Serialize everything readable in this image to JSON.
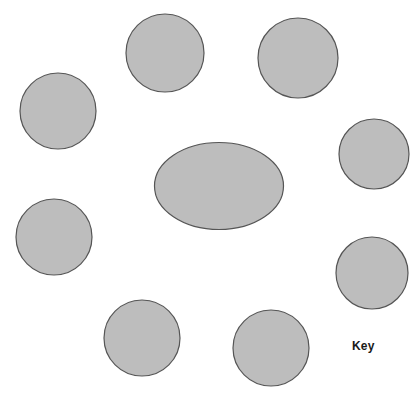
{
  "figure": {
    "type": "node-diagram",
    "background_color": "#ffffff",
    "shape_fill_color": "#bdbdbd",
    "shape_stroke_color": "#555555",
    "shape_stroke_width": 1.2,
    "width": 419,
    "height": 393
  },
  "center_node": {
    "name": "central-ellipse",
    "shape": "ellipse",
    "cx": 219,
    "cy": 186,
    "rx": 64.5,
    "ry": 43.5,
    "label": ""
  },
  "satellite_nodes": [
    {
      "name": "node-top-center",
      "shape": "circle",
      "cx": 165,
      "cy": 53,
      "r": 39,
      "label": ""
    },
    {
      "name": "node-top-right",
      "shape": "circle",
      "cx": 298,
      "cy": 58,
      "r": 40,
      "label": ""
    },
    {
      "name": "node-upper-left",
      "shape": "circle",
      "cx": 58,
      "cy": 111,
      "r": 38,
      "label": ""
    },
    {
      "name": "node-right-upper",
      "shape": "circle",
      "cx": 374,
      "cy": 154,
      "r": 35,
      "label": ""
    },
    {
      "name": "node-left-middle",
      "shape": "circle",
      "cx": 54,
      "cy": 237,
      "r": 38,
      "label": ""
    },
    {
      "name": "node-right-lower",
      "shape": "circle",
      "cx": 372,
      "cy": 273,
      "r": 36,
      "label": ""
    },
    {
      "name": "node-bottom-left",
      "shape": "circle",
      "cx": 142,
      "cy": 338,
      "r": 38,
      "label": ""
    },
    {
      "name": "node-bottom-center",
      "shape": "circle",
      "cx": 271,
      "cy": 348,
      "r": 38,
      "label": ""
    }
  ],
  "key": {
    "label": "Key",
    "x": 352,
    "y": 340
  }
}
